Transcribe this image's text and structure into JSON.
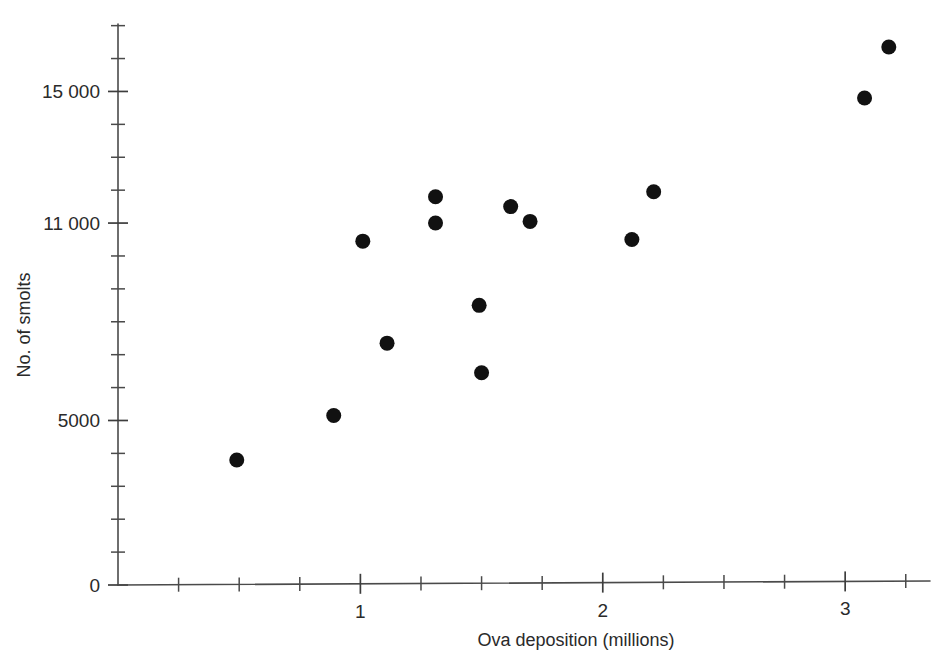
{
  "chart_data": {
    "type": "scatter",
    "title": "",
    "xlabel": "Ova deposition (millions)",
    "ylabel": "No. of smolts",
    "xlim": [
      0,
      3.35
    ],
    "ylim": [
      0,
      17050
    ],
    "grid": false,
    "legend": null,
    "x_ticklabels": [
      "1",
      "2",
      "3"
    ],
    "x_tickvalues": [
      1,
      2,
      3
    ],
    "x_minor_step": 0.25,
    "y_ticklabels": [
      "0",
      "5000",
      "11 000",
      "15 000"
    ],
    "y_tickvalues": [
      0,
      5000,
      11000,
      15000
    ],
    "y_minor_step": 1000,
    "marker": "filled-circle",
    "marker_color": "#111111",
    "points": [
      {
        "x": 0.49,
        "y": 3800
      },
      {
        "x": 0.89,
        "y": 5150
      },
      {
        "x": 1.01,
        "y": 10450
      },
      {
        "x": 1.11,
        "y": 7350
      },
      {
        "x": 1.31,
        "y": 11800
      },
      {
        "x": 1.31,
        "y": 11000
      },
      {
        "x": 1.49,
        "y": 8500
      },
      {
        "x": 1.5,
        "y": 6450
      },
      {
        "x": 1.62,
        "y": 11500
      },
      {
        "x": 1.7,
        "y": 11050
      },
      {
        "x": 2.12,
        "y": 10500
      },
      {
        "x": 2.21,
        "y": 11950
      },
      {
        "x": 3.08,
        "y": 14800
      },
      {
        "x": 3.18,
        "y": 16350
      }
    ]
  },
  "axis": {
    "x_title": "Ova deposition (millions)",
    "y_title": "No. of smolts",
    "y_labels": [
      {
        "value": 15000,
        "text": "15 000"
      },
      {
        "value": 11000,
        "text": "11 000"
      },
      {
        "value": 5000,
        "text": "5000"
      },
      {
        "value": 0,
        "text": "0"
      }
    ],
    "x_labels": [
      {
        "value": 1,
        "text": "1"
      },
      {
        "value": 2,
        "text": "2"
      },
      {
        "value": 3,
        "text": "3"
      }
    ]
  }
}
